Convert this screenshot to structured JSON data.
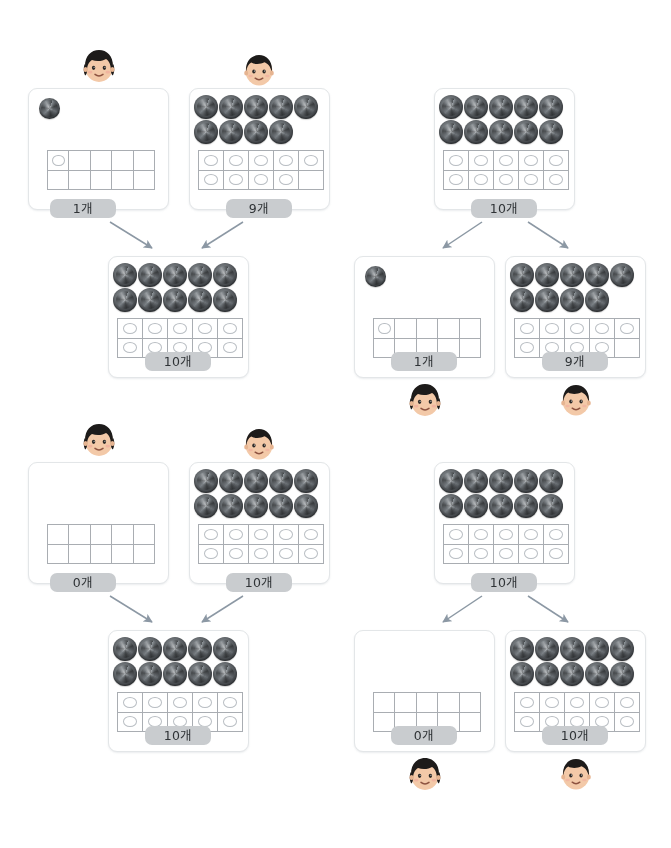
{
  "page": {
    "object_name": "swirl-candy",
    "unit_suffix": "개",
    "colors": {
      "card_border": "#e3e6e8",
      "pill_background": "#c9cccf",
      "pill_text": "#2f3336",
      "frame_line": "#a9adb2",
      "dot_outline": "#b9bec3",
      "arrow": "#8c98a4",
      "swirl_dark": "#3d4145",
      "swirl_light": "#8d9296",
      "page_background": "#ffffff"
    }
  },
  "panels": [
    {
      "id": "top-left",
      "kind": "compose",
      "description": "1개와 9개를 모으면 10개",
      "top_cards": [
        {
          "id": "tl-a",
          "label": "1개",
          "count": 1,
          "face": "girl",
          "swirls": 1,
          "dots": 1
        },
        {
          "id": "tl-b",
          "label": "9개",
          "count": 9,
          "face": "boy",
          "swirls": 9,
          "dots": 9
        }
      ],
      "bottom_cards": [
        {
          "id": "tl-sum",
          "label": "10개",
          "count": 10,
          "face": null,
          "swirls": 10,
          "dots": 10
        }
      ],
      "arrows": [
        {
          "from": "tl-a",
          "to": "tl-sum",
          "direction": "down-right"
        },
        {
          "from": "tl-b",
          "to": "tl-sum",
          "direction": "down-left"
        }
      ]
    },
    {
      "id": "top-right",
      "kind": "decompose",
      "description": "10개를 1개와 9개로 가르기",
      "top_cards": [
        {
          "id": "tr-sum",
          "label": "10개",
          "count": 10,
          "face": null,
          "swirls": 10,
          "dots": 10
        }
      ],
      "bottom_cards": [
        {
          "id": "tr-a",
          "label": "1개",
          "count": 1,
          "face": "girl",
          "swirls": 1,
          "dots": 1
        },
        {
          "id": "tr-b",
          "label": "9개",
          "count": 9,
          "face": "boy",
          "swirls": 9,
          "dots": 9
        }
      ],
      "arrows": [
        {
          "from": "tr-sum",
          "to": "tr-a",
          "direction": "down-left"
        },
        {
          "from": "tr-sum",
          "to": "tr-b",
          "direction": "down-right"
        }
      ]
    },
    {
      "id": "bottom-left",
      "kind": "compose",
      "description": "0개와 10개를 모으면 10개",
      "top_cards": [
        {
          "id": "bl-a",
          "label": "0개",
          "count": 0,
          "face": "girl",
          "swirls": 0,
          "dots": 0
        },
        {
          "id": "bl-b",
          "label": "10개",
          "count": 10,
          "face": "boy",
          "swirls": 10,
          "dots": 10
        }
      ],
      "bottom_cards": [
        {
          "id": "bl-sum",
          "label": "10개",
          "count": 10,
          "face": null,
          "swirls": 10,
          "dots": 10
        }
      ],
      "arrows": [
        {
          "from": "bl-a",
          "to": "bl-sum",
          "direction": "down-right"
        },
        {
          "from": "bl-b",
          "to": "bl-sum",
          "direction": "down-left"
        }
      ]
    },
    {
      "id": "bottom-right",
      "kind": "decompose",
      "description": "10개를 0개와 10개로 가르기",
      "top_cards": [
        {
          "id": "br-sum",
          "label": "10개",
          "count": 10,
          "face": null,
          "swirls": 10,
          "dots": 10
        }
      ],
      "bottom_cards": [
        {
          "id": "br-a",
          "label": "0개",
          "count": 0,
          "face": "girl",
          "swirls": 0,
          "dots": 0
        },
        {
          "id": "br-b",
          "label": "10개",
          "count": 10,
          "face": "boy",
          "swirls": 10,
          "dots": 10
        }
      ],
      "arrows": [
        {
          "from": "br-sum",
          "to": "br-a",
          "direction": "down-left"
        },
        {
          "from": "br-sum",
          "to": "br-b",
          "direction": "down-right"
        }
      ]
    }
  ],
  "layout": {
    "cards": {
      "tl-a": {
        "x": 28,
        "y": 88,
        "w": 141,
        "h": 122,
        "frame": {
          "x": 18,
          "y": 61,
          "w": 108,
          "h": 40
        },
        "pill": {
          "x": 50,
          "y": 199,
          "w": 66
        },
        "face": {
          "x": 76,
          "y": 42
        },
        "swirl_origin": {
          "x": 10,
          "y": 9
        },
        "swirl_size": 21,
        "swirl_gap": 0
      },
      "tl-b": {
        "x": 189,
        "y": 88,
        "w": 141,
        "h": 122,
        "frame": {
          "x": 8,
          "y": 61,
          "w": 126,
          "h": 40
        },
        "pill": {
          "x": 226,
          "y": 199,
          "w": 66
        },
        "face": {
          "x": 236,
          "y": 46
        },
        "swirl_origin": {
          "x": 4,
          "y": 6
        },
        "swirl_size": 24,
        "swirl_gap": 1
      },
      "tl-sum": {
        "x": 108,
        "y": 256,
        "w": 141,
        "h": 122,
        "frame": {
          "x": 8,
          "y": 61,
          "w": 126,
          "h": 40
        },
        "pill": {
          "x": 145,
          "y": 352,
          "w": 66
        },
        "face": null,
        "swirl_origin": {
          "x": 4,
          "y": 6
        },
        "swirl_size": 24,
        "swirl_gap": 1
      },
      "tr-sum": {
        "x": 434,
        "y": 88,
        "w": 141,
        "h": 122,
        "frame": {
          "x": 8,
          "y": 61,
          "w": 126,
          "h": 40
        },
        "pill": {
          "x": 471,
          "y": 199,
          "w": 66
        },
        "face": null,
        "swirl_origin": {
          "x": 4,
          "y": 6
        },
        "swirl_size": 24,
        "swirl_gap": 1
      },
      "tr-a": {
        "x": 354,
        "y": 256,
        "w": 141,
        "h": 122,
        "frame": {
          "x": 18,
          "y": 61,
          "w": 108,
          "h": 40
        },
        "pill": {
          "x": 391,
          "y": 352,
          "w": 66
        },
        "face": {
          "x": 402,
          "y": 376
        },
        "swirl_origin": {
          "x": 10,
          "y": 9
        },
        "swirl_size": 21,
        "swirl_gap": 0
      },
      "tr-b": {
        "x": 505,
        "y": 256,
        "w": 141,
        "h": 122,
        "frame": {
          "x": 8,
          "y": 61,
          "w": 126,
          "h": 40
        },
        "pill": {
          "x": 542,
          "y": 352,
          "w": 66
        },
        "face": {
          "x": 553,
          "y": 376
        },
        "swirl_origin": {
          "x": 4,
          "y": 6
        },
        "swirl_size": 24,
        "swirl_gap": 1
      },
      "bl-a": {
        "x": 28,
        "y": 462,
        "w": 141,
        "h": 122,
        "frame": {
          "x": 18,
          "y": 61,
          "w": 108,
          "h": 40
        },
        "pill": {
          "x": 50,
          "y": 573,
          "w": 66
        },
        "face": {
          "x": 76,
          "y": 416
        },
        "swirl_origin": {
          "x": 10,
          "y": 9
        },
        "swirl_size": 21,
        "swirl_gap": 0
      },
      "bl-b": {
        "x": 189,
        "y": 462,
        "w": 141,
        "h": 122,
        "frame": {
          "x": 8,
          "y": 61,
          "w": 126,
          "h": 40
        },
        "pill": {
          "x": 226,
          "y": 573,
          "w": 66
        },
        "face": {
          "x": 236,
          "y": 420
        },
        "swirl_origin": {
          "x": 4,
          "y": 6
        },
        "swirl_size": 24,
        "swirl_gap": 1
      },
      "bl-sum": {
        "x": 108,
        "y": 630,
        "w": 141,
        "h": 122,
        "frame": {
          "x": 8,
          "y": 61,
          "w": 126,
          "h": 40
        },
        "pill": {
          "x": 145,
          "y": 726,
          "w": 66
        },
        "face": null,
        "swirl_origin": {
          "x": 4,
          "y": 6
        },
        "swirl_size": 24,
        "swirl_gap": 1
      },
      "br-sum": {
        "x": 434,
        "y": 462,
        "w": 141,
        "h": 122,
        "frame": {
          "x": 8,
          "y": 61,
          "w": 126,
          "h": 40
        },
        "pill": {
          "x": 471,
          "y": 573,
          "w": 66
        },
        "face": null,
        "swirl_origin": {
          "x": 4,
          "y": 6
        },
        "swirl_size": 24,
        "swirl_gap": 1
      },
      "br-a": {
        "x": 354,
        "y": 630,
        "w": 141,
        "h": 122,
        "frame": {
          "x": 18,
          "y": 61,
          "w": 108,
          "h": 40
        },
        "pill": {
          "x": 391,
          "y": 726,
          "w": 66
        },
        "face": {
          "x": 402,
          "y": 750
        },
        "swirl_origin": {
          "x": 10,
          "y": 9
        },
        "swirl_size": 21,
        "swirl_gap": 0
      },
      "br-b": {
        "x": 505,
        "y": 630,
        "w": 141,
        "h": 122,
        "frame": {
          "x": 8,
          "y": 61,
          "w": 126,
          "h": 40
        },
        "pill": {
          "x": 542,
          "y": 726,
          "w": 66
        },
        "face": {
          "x": 553,
          "y": 750
        },
        "swirl_origin": {
          "x": 4,
          "y": 6
        },
        "swirl_size": 24,
        "swirl_gap": 1
      }
    },
    "arrows": [
      {
        "name": "arrow-tl-a",
        "x1": 110,
        "y1": 222,
        "x2": 152,
        "y2": 248
      },
      {
        "name": "arrow-tl-b",
        "x1": 243,
        "y1": 222,
        "x2": 202,
        "y2": 248
      },
      {
        "name": "arrow-tr-left",
        "x1": 482,
        "y1": 222,
        "x2": 443,
        "y2": 248
      },
      {
        "name": "arrow-tr-right",
        "x1": 528,
        "y1": 222,
        "x2": 568,
        "y2": 248
      },
      {
        "name": "arrow-bl-a",
        "x1": 110,
        "y1": 596,
        "x2": 152,
        "y2": 622
      },
      {
        "name": "arrow-bl-b",
        "x1": 243,
        "y1": 596,
        "x2": 202,
        "y2": 622
      },
      {
        "name": "arrow-br-left",
        "x1": 482,
        "y1": 596,
        "x2": 443,
        "y2": 622
      },
      {
        "name": "arrow-br-right",
        "x1": 528,
        "y1": 596,
        "x2": 568,
        "y2": 622
      }
    ]
  }
}
